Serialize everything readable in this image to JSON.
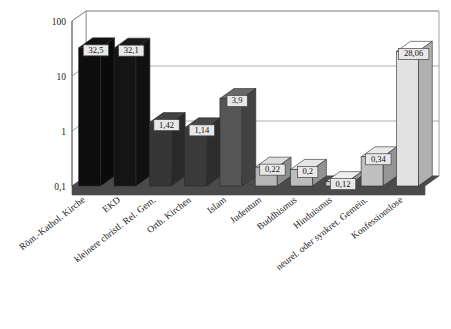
{
  "chart_data": {
    "type": "bar",
    "title": "",
    "subtitle": "",
    "xlabel": "",
    "ylabel": "",
    "yscale": "log",
    "ylim": [
      0.1,
      100
    ],
    "ytick_labels": [
      "100",
      "10",
      "1",
      "0,1"
    ],
    "ytick_values": [
      100,
      10,
      1,
      0.1
    ],
    "grid": true,
    "legend": "none",
    "style": "3d-perspective",
    "categories": [
      "Röm.-Kathol. Kirche",
      "EKD",
      "kleinere christl. Rel. Gem.",
      "Orth. Kirchen",
      "Islam",
      "Judentum",
      "Buddhismus",
      "Hinduismus",
      "neurel. oder synkret. Gemein.",
      "Konfessionslose"
    ],
    "values": [
      32.5,
      32.1,
      1.42,
      1.14,
      3.9,
      0.22,
      0.2,
      0.12,
      0.34,
      28.06
    ],
    "value_labels": [
      "32,5",
      "32,1",
      "1,42",
      "1,14",
      "3,9",
      "0,22",
      "0,2",
      "0,12",
      "0,34",
      "28,06"
    ],
    "bar_colors": [
      "#0d0d0d",
      "#141414",
      "#363636",
      "#3a3a3a",
      "#555555",
      "#b5b5b5",
      "#bcbcbc",
      "#c4c4c4",
      "#c0c0c0",
      "#e2e2e2"
    ],
    "colors": {
      "floor": "#4a4a4a",
      "axis": "#555555",
      "grid": "#9a9a9a",
      "frame": "#8a8a8a",
      "background": "#ffffff",
      "label_box_fill": "#e8e8e8",
      "label_box_stroke": "#444444"
    }
  }
}
